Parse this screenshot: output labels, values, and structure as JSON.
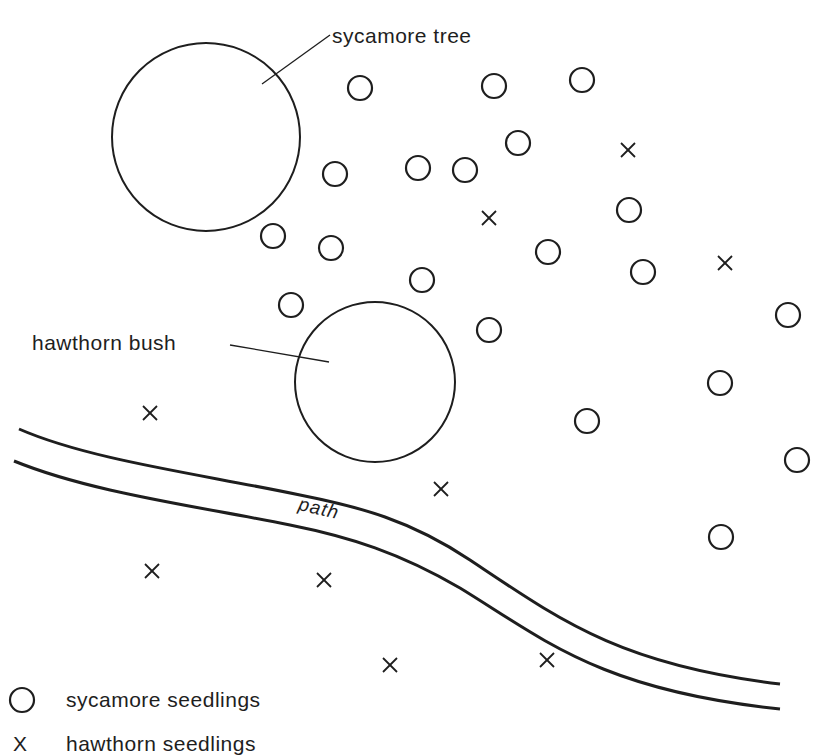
{
  "colors": {
    "ink": "#1e1e1e",
    "background": "#ffffff"
  },
  "labels": {
    "sycamore_tree": "sycamore tree",
    "hawthorn_bush": "hawthorn bush",
    "path": "path"
  },
  "legend": {
    "sycamore": {
      "symbol": "circle",
      "label": "sycamore seedlings"
    },
    "hawthorn": {
      "symbol": "X",
      "label": "hawthorn seedlings"
    }
  },
  "features": {
    "sycamore_tree": {
      "cx": 206,
      "cy": 137,
      "r": 94
    },
    "hawthorn_bush": {
      "cx": 375,
      "cy": 382,
      "r": 80
    }
  },
  "sycamore_seedlings": [
    {
      "x": 360,
      "y": 88
    },
    {
      "x": 494,
      "y": 86
    },
    {
      "x": 582,
      "y": 80
    },
    {
      "x": 518,
      "y": 143
    },
    {
      "x": 335,
      "y": 174
    },
    {
      "x": 418,
      "y": 168
    },
    {
      "x": 465,
      "y": 170
    },
    {
      "x": 629,
      "y": 210
    },
    {
      "x": 273,
      "y": 236
    },
    {
      "x": 331,
      "y": 248
    },
    {
      "x": 548,
      "y": 252
    },
    {
      "x": 643,
      "y": 272
    },
    {
      "x": 422,
      "y": 280
    },
    {
      "x": 291,
      "y": 305
    },
    {
      "x": 489,
      "y": 330
    },
    {
      "x": 788,
      "y": 315
    },
    {
      "x": 720,
      "y": 383
    },
    {
      "x": 587,
      "y": 421
    },
    {
      "x": 797,
      "y": 460
    },
    {
      "x": 721,
      "y": 537
    }
  ],
  "hawthorn_seedlings": [
    {
      "x": 628,
      "y": 150
    },
    {
      "x": 489,
      "y": 218
    },
    {
      "x": 725,
      "y": 263
    },
    {
      "x": 150,
      "y": 413
    },
    {
      "x": 441,
      "y": 489
    },
    {
      "x": 152,
      "y": 571
    },
    {
      "x": 324,
      "y": 580
    },
    {
      "x": 390,
      "y": 665
    },
    {
      "x": 547,
      "y": 660
    }
  ],
  "counts": {
    "sycamore_seedlings": 20,
    "hawthorn_seedlings": 9
  }
}
